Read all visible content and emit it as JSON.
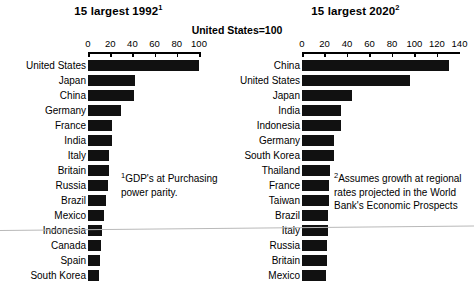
{
  "chart_data": {
    "type": "bar",
    "subtitle": "United States=100",
    "orientation": "horizontal",
    "grid": false,
    "legend": false,
    "panels": [
      {
        "id": "left",
        "title": "15 largest 1992",
        "title_superscript": "1",
        "xlabel": "",
        "ylabel": "",
        "xlim": [
          0,
          100
        ],
        "xticks": [
          0,
          20,
          40,
          60,
          80,
          100
        ],
        "xticklabels": [
          "0",
          "20",
          "40",
          "60",
          "80",
          "100"
        ],
        "categories": [
          "United States",
          "Japan",
          "China",
          "Germany",
          "France",
          "India",
          "Italy",
          "Britain",
          "Russia",
          "Brazil",
          "Mexico",
          "Indonesia",
          "Canada",
          "Spain",
          "South Korea"
        ],
        "values": [
          100,
          42,
          41,
          30,
          22,
          22,
          19,
          19,
          18,
          16,
          14,
          13,
          12,
          11,
          10
        ],
        "footnote": "GDP's at Purchasing power parity.",
        "footnote_marker": "1"
      },
      {
        "id": "right",
        "title": "15 largest 2020",
        "title_superscript": "2",
        "xlabel": "",
        "ylabel": "",
        "xlim": [
          0,
          140
        ],
        "xticks": [
          0,
          20,
          40,
          60,
          80,
          100,
          120,
          140
        ],
        "xticklabels": [
          "0",
          "20",
          "40",
          "60",
          "80",
          "100",
          "120",
          "140"
        ],
        "categories": [
          "China",
          "United States",
          "Japan",
          "India",
          "Indonesia",
          "Germany",
          "South Korea",
          "Thailand",
          "France",
          "Taiwan",
          "Brazil",
          "Italy",
          "Russia",
          "Britain",
          "Mexico"
        ],
        "values": [
          131,
          96,
          44,
          35,
          35,
          28,
          28,
          25,
          24,
          24,
          23,
          23,
          22,
          22,
          21
        ],
        "footnote": "Assumes growth at regional rates projected in the World Bank's Economic Prospects",
        "footnote_marker": "2"
      }
    ],
    "colors": {
      "bar": "#111111",
      "axis": "#000000",
      "background": "#ffffff",
      "text": "#000000"
    }
  }
}
